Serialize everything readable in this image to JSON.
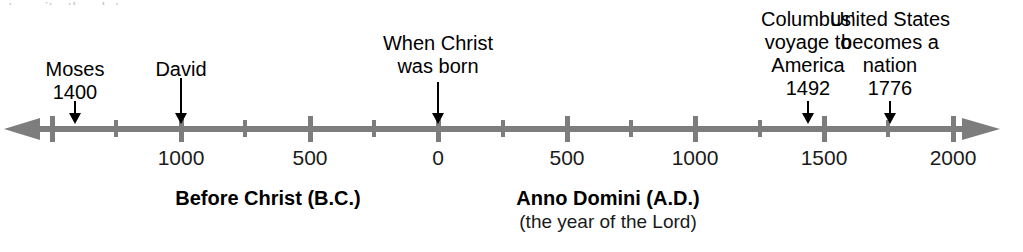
{
  "figure": {
    "top_cropped_text": "to write the dates."
  },
  "chart_data": {
    "type": "timeline",
    "title": "",
    "axis": {
      "orientation": "horizontal",
      "arrows_both_ends": true,
      "color": "#7d7d7d",
      "range_years": [
        -1500,
        2000
      ],
      "major_tick_interval": 500,
      "minor_tick_interval": 250,
      "grid": false
    },
    "tick_labels": [
      {
        "year": -1000,
        "text": "1000",
        "x": 181
      },
      {
        "year": -500,
        "text": "500",
        "x": 310
      },
      {
        "year": 0,
        "text": "0",
        "x": 438
      },
      {
        "year": 500,
        "text": "500",
        "x": 567
      },
      {
        "year": 1000,
        "text": "1000",
        "x": 695
      },
      {
        "year": 1500,
        "text": "1500",
        "x": 824
      },
      {
        "year": 2000,
        "text": "2000",
        "x": 953
      }
    ],
    "major_ticks_x": [
      52,
      181,
      310,
      438,
      567,
      695,
      824,
      953
    ],
    "minor_ticks_x": [
      116,
      245,
      374,
      503,
      631,
      760,
      888
    ],
    "eras": [
      {
        "title": "Before Christ (B.C.)",
        "subtitle": "",
        "x": 268
      },
      {
        "title": "Anno Domini (A.D.)",
        "subtitle": "(the year of the Lord)",
        "x": 608
      }
    ],
    "events": [
      {
        "name": "Moses",
        "label_lines": [
          "Moses"
        ],
        "year_text": "1400",
        "year": -1400,
        "x": 75,
        "label_top": 58,
        "arrow_top": 101,
        "arrow_height": 23
      },
      {
        "name": "David",
        "label_lines": [
          "David"
        ],
        "year_text": "",
        "year": -1000,
        "x": 181,
        "label_top": 58,
        "arrow_top": 78,
        "arrow_height": 46
      },
      {
        "name": "When Christ was born",
        "label_lines": [
          "When Christ",
          "was born"
        ],
        "year_text": "",
        "year": 0,
        "x": 438,
        "label_top": 32,
        "arrow_top": 82,
        "arrow_height": 42
      },
      {
        "name": "Columbus' voyage to America",
        "label_lines": [
          "Columbus'",
          "voyage to",
          "America"
        ],
        "year_text": "1492",
        "year": 1492,
        "x": 808,
        "label_top": 8,
        "arrow_top": 101,
        "arrow_height": 23
      },
      {
        "name": "United States becomes a nation",
        "label_lines": [
          "United States",
          "becomes a",
          "nation"
        ],
        "year_text": "1776",
        "year": 1776,
        "x": 890,
        "label_top": 8,
        "arrow_top": 101,
        "arrow_height": 23
      }
    ]
  }
}
